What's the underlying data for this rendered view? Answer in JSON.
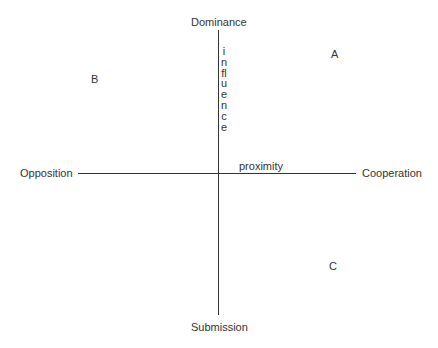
{
  "diagram": {
    "type": "two-axis interpersonal grid",
    "vertical_axis": {
      "top_label": "Dominance",
      "bottom_label": "Submission",
      "axis_label": "influence"
    },
    "horizontal_axis": {
      "left_label": "Opposition",
      "right_label": "Cooperation",
      "axis_label": "proximity"
    },
    "points": [
      {
        "label": "A",
        "quadrant": "Dominance-Cooperation"
      },
      {
        "label": "B",
        "quadrant": "Dominance-Opposition"
      },
      {
        "label": "C",
        "quadrant": "Submission-Cooperation"
      }
    ],
    "colors": {
      "line": "#333333",
      "text": "#333333",
      "background": "#ffffff"
    }
  }
}
